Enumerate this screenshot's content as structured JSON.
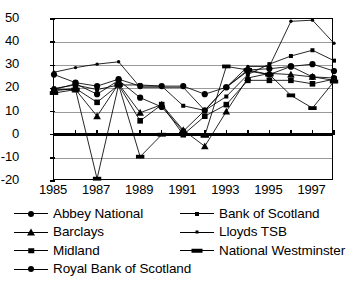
{
  "chart_data": {
    "type": "line",
    "title": "",
    "subtitle": "",
    "xlabel": "",
    "ylabel": "",
    "xlim": [
      1985,
      1998
    ],
    "ylim": [
      -20,
      50
    ],
    "yticks": [
      -20,
      -10,
      0,
      10,
      20,
      30,
      40,
      50
    ],
    "ytick_labels": [
      "-20",
      "-10",
      "0",
      "10",
      "20",
      "30",
      "40",
      "50"
    ],
    "xticks": [
      1985,
      1986,
      1987,
      1988,
      1989,
      1990,
      1991,
      1992,
      1993,
      1994,
      1995,
      1996,
      1997,
      1998
    ],
    "xtick_labels": [
      "1985",
      "",
      "1987",
      "",
      "1989",
      "",
      "1991",
      "",
      "1993",
      "",
      "1995",
      "",
      "1997",
      ""
    ],
    "xtick_labels_shown": [
      "1985",
      "1987",
      "1989",
      "1991",
      "1993",
      "1995",
      "1997"
    ],
    "grid": true,
    "grid_axis": "y",
    "zero_line": true,
    "legend_position": "below",
    "legend_columns": 2,
    "x": [
      1985,
      1986,
      1987,
      1988,
      1989,
      1990,
      1991,
      1992,
      1993,
      1994,
      1995,
      1996,
      1997,
      1998
    ],
    "series": [
      {
        "name": "Abbey National",
        "marker": "circle",
        "marker_size": 6,
        "color": "#000000",
        "values": [
          26.0,
          22.5,
          21.0,
          24.0,
          21.0,
          21.0,
          21.0,
          17.5,
          20.5,
          28.0,
          28.5,
          29.5,
          30.5,
          27.5
        ]
      },
      {
        "name": "Bank of Scotland",
        "marker": "square-small",
        "marker_size": 4,
        "color": "#000000",
        "values": [
          20.0,
          21.5,
          19.5,
          21.5,
          21.5,
          21.0,
          12.5,
          10.5,
          16.5,
          26.0,
          30.5,
          34.0,
          36.5,
          32.0
        ]
      },
      {
        "name": "Barclays",
        "marker": "triangle",
        "marker_size": 7,
        "color": "#000000",
        "values": [
          19.5,
          19.5,
          8.0,
          22.0,
          9.5,
          13.0,
          2.0,
          -5.0,
          10.0,
          24.5,
          26.5,
          26.0,
          25.0,
          23.5
        ]
      },
      {
        "name": "Lloyds TSB",
        "marker": "dot",
        "marker_size": 3,
        "color": "#000000",
        "values": [
          27.0,
          29.0,
          30.5,
          31.5,
          20.5,
          20.5,
          20.5,
          10.5,
          20.5,
          29.5,
          29.5,
          49.0,
          49.5,
          39.5
        ]
      },
      {
        "name": "Midland",
        "marker": "square",
        "marker_size": 5.5,
        "color": "#000000",
        "values": [
          19.0,
          20.0,
          14.0,
          21.5,
          6.0,
          13.0,
          0.0,
          8.0,
          13.0,
          23.5,
          23.5,
          23.5,
          22.0,
          24.0
        ]
      },
      {
        "name": "National Westminster",
        "marker": "bar",
        "marker_size": 5,
        "color": "#000000",
        "values": [
          18.0,
          19.5,
          -19.0,
          21.5,
          -9.5,
          0.0,
          0.5,
          -0.5,
          29.5,
          28.0,
          26.0,
          17.0,
          11.5,
          23.0
        ]
      },
      {
        "name": "Royal Bank of Scotland",
        "marker": "circle",
        "marker_size": 6,
        "color": "#000000",
        "values": [
          19.5,
          22.0,
          17.5,
          23.5,
          16.0,
          12.0,
          1.5,
          10.5,
          20.5,
          27.5,
          26.0,
          29.5,
          25.0,
          24.5
        ]
      }
    ]
  },
  "legend": {
    "entries": [
      {
        "label": "Abbey National",
        "marker": "circle",
        "icon": "legend-marker-circle-icon"
      },
      {
        "label": "Bank of Scotland",
        "marker": "square-small",
        "icon": "legend-marker-square-small-icon"
      },
      {
        "label": "Barclays",
        "marker": "triangle",
        "icon": "legend-marker-triangle-icon"
      },
      {
        "label": "Lloyds TSB",
        "marker": "dot",
        "icon": "legend-marker-dot-icon"
      },
      {
        "label": "Midland",
        "marker": "square",
        "icon": "legend-marker-square-icon"
      },
      {
        "label": "National Westminster",
        "marker": "bar",
        "icon": "legend-marker-bar-icon"
      },
      {
        "label": "Royal Bank of Scotland",
        "marker": "circle",
        "icon": "legend-marker-circle-icon"
      }
    ]
  },
  "colors": {
    "series": "#000000",
    "gridline": "#9a9a9a",
    "axis": "#000000",
    "background": "#ffffff"
  }
}
